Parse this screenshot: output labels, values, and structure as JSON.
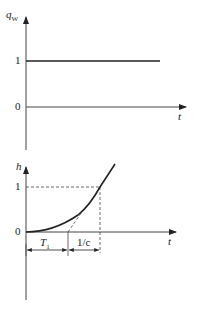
{
  "top_plot": {
    "y_label": "q",
    "y_label_sub": "W",
    "x_label": "t",
    "ticks": [
      "1",
      "0"
    ],
    "series": "step input q_W = 1 for t >= 0"
  },
  "bottom_plot": {
    "y_label": "h",
    "x_label": "t",
    "ticks": [
      "1",
      "0"
    ],
    "dim_T1": "T",
    "dim_T1_sub": "1",
    "dim_c": "1/c",
    "series": "response h(t) with delay T1 and tangent slope c"
  },
  "colors": {
    "line": "#222222",
    "background": "#ffffff"
  }
}
